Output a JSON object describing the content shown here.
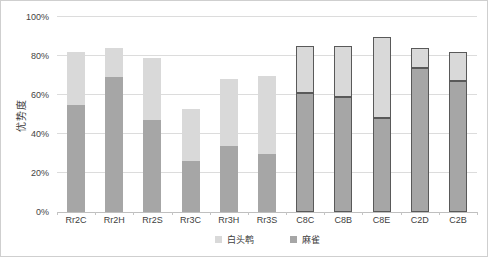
{
  "figure": {
    "background": "#ffffff",
    "border_color": "#cfcfcf"
  },
  "chart_data": {
    "type": "bar",
    "stacked": true,
    "title": "",
    "xlabel": "",
    "ylabel": "优势度",
    "ylim": [
      0,
      100
    ],
    "ytick_step": 20,
    "ytick_labels": [
      "0%",
      "20%",
      "40%",
      "60%",
      "80%",
      "100%"
    ],
    "grid": true,
    "legend_position": "bottom",
    "categories": [
      "Rr2C",
      "Rr2H",
      "Rr2S",
      "Rr3C",
      "Rr3H",
      "Rr3S",
      "C8C",
      "C8B",
      "C8E",
      "C2D",
      "C2B"
    ],
    "series": [
      {
        "name": "麻雀",
        "color": "#a6a6a6",
        "values": [
          55,
          69,
          47,
          26,
          34,
          30,
          61,
          59,
          48,
          74,
          67
        ]
      },
      {
        "name": "白头鹎",
        "color": "#d9d9d9",
        "values": [
          27,
          15,
          32,
          27,
          34,
          40,
          24,
          26,
          42,
          10,
          15
        ]
      }
    ],
    "stacked_totals": [
      82,
      84,
      79,
      53,
      68,
      70,
      85,
      85,
      90,
      84,
      82
    ],
    "legend_order": [
      "白头鹎",
      "麻雀"
    ],
    "outlined_categories": [
      "C8C",
      "C8B",
      "C8E",
      "C2D",
      "C2B"
    ],
    "outline_color": "#595959",
    "gridline_color": "#dcdcdc",
    "axis_line_color": "#bfbfbf"
  }
}
